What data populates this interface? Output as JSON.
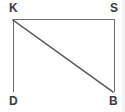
{
  "figure": {
    "background_color": "#ffffff",
    "width": 125,
    "height": 112,
    "line_color": "#6e6e6e",
    "diagonal_color": "#555555",
    "label_color": "#3b3b3b",
    "vertices": [
      {
        "id": "K",
        "label": "K",
        "x": 13,
        "y": 19,
        "label_x": 9,
        "label_y": 2
      },
      {
        "id": "S",
        "label": "S",
        "x": 114,
        "y": 19,
        "label_x": 110,
        "label_y": 2
      },
      {
        "id": "D",
        "label": "D",
        "x": 13,
        "y": 92,
        "label_x": 9,
        "label_y": 95
      },
      {
        "id": "B",
        "label": "B",
        "x": 114,
        "y": 92,
        "label_x": 109,
        "label_y": 95
      }
    ],
    "segments": [
      {
        "id": "KS",
        "name": "top-edge",
        "from": "K",
        "to": "S",
        "x1": 13,
        "y1": 19,
        "x2": 114,
        "y2": 19,
        "width": 1,
        "color": "#6e6e6e"
      },
      {
        "id": "KD",
        "name": "left-edge",
        "from": "K",
        "to": "D",
        "x1": 13,
        "y1": 19,
        "x2": 13,
        "y2": 92,
        "width": 1,
        "color": "#6e6e6e"
      },
      {
        "id": "SB",
        "name": "right-edge",
        "from": "S",
        "to": "B",
        "x1": 114,
        "y1": 19,
        "x2": 114,
        "y2": 92,
        "width": 1,
        "color": "#6e6e6e"
      },
      {
        "id": "KB",
        "name": "diagonal",
        "from": "K",
        "to": "B",
        "x1": 13,
        "y1": 20,
        "x2": 113,
        "y2": 92,
        "width": 1.4,
        "color": "#555555"
      }
    ]
  }
}
